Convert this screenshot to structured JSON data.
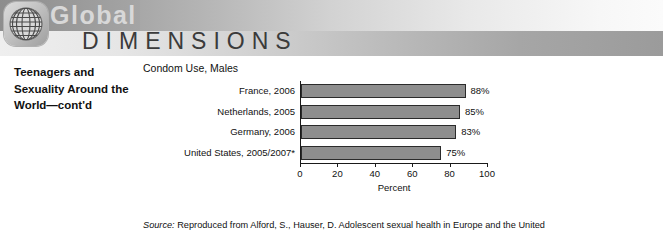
{
  "banner": {
    "brand_primary": "Global",
    "brand_secondary": "DIMENSIONS",
    "globe_icon": "globe-grid-icon"
  },
  "sidebar": {
    "heading": "Teenagers and Sexuality Around the World—cont'd"
  },
  "source": {
    "label": "Source:",
    "text": " Reproduced from Alford, S., Hauser, D. Adolescent sexual health in Europe and the United"
  },
  "chart_data": {
    "type": "bar",
    "orientation": "horizontal",
    "title": "Condom Use, Males",
    "xlabel": "Percent",
    "ylabel": "",
    "xlim": [
      0,
      100
    ],
    "xticks": [
      0,
      20,
      40,
      60,
      80,
      100
    ],
    "grid": false,
    "legend": "none",
    "categories": [
      "France, 2006",
      "Netherlands, 2005",
      "Germany, 2006",
      "United States, 2005/2007*"
    ],
    "values": [
      88,
      85,
      83,
      75
    ],
    "value_labels": [
      "88%",
      "85%",
      "83%",
      "75%"
    ],
    "bar_color": "#8e8e8e",
    "bar_border_color": "#2b2b2b",
    "axis_color": "#1a1a1a"
  }
}
